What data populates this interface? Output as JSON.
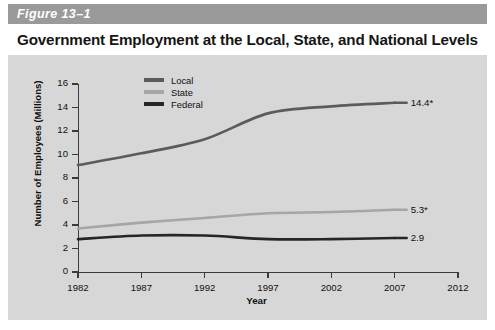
{
  "figure": {
    "label": "Figure 13–1",
    "title": "Government Employment at the Local, State, and National Levels",
    "band_color": "#9a9a9a",
    "panel_color": "#d7d7d7"
  },
  "legend": {
    "position": "top-center-left",
    "items": [
      {
        "label": "Local",
        "color": "#5b5b5b"
      },
      {
        "label": "State",
        "color": "#a6a6a6"
      },
      {
        "label": "Federal",
        "color": "#262626"
      }
    ]
  },
  "axes": {
    "y_title": "Number of Employees (Millions)",
    "x_title": "Year",
    "y_ticks": [
      "0",
      "2",
      "4",
      "6",
      "8",
      "10",
      "12",
      "14",
      "16"
    ],
    "x_ticks": [
      "1982",
      "1987",
      "1992",
      "1997",
      "2002",
      "2007",
      "2012"
    ]
  },
  "series_labels": {
    "local": "14.4*",
    "state": "5.3*",
    "federal": "2.9"
  },
  "chart_data": {
    "type": "line",
    "title": "Government Employment at the Local, State, and National Levels",
    "xlabel": "Year",
    "ylabel": "Number of Employees (Millions)",
    "xlim": [
      1982,
      2012
    ],
    "ylim": [
      0,
      16
    ],
    "ytick_step": 2,
    "grid": false,
    "legend_position": "top-center",
    "x": [
      1982,
      1987,
      1992,
      1997,
      2002,
      2007
    ],
    "series": [
      {
        "name": "Local",
        "color": "#5b5b5b",
        "values": [
          9.1,
          10.1,
          11.3,
          13.5,
          14.1,
          14.4
        ],
        "end_label": "14.4*"
      },
      {
        "name": "State",
        "color": "#a6a6a6",
        "values": [
          3.7,
          4.2,
          4.6,
          5.0,
          5.1,
          5.3
        ],
        "end_label": "5.3*"
      },
      {
        "name": "Federal",
        "color": "#262626",
        "values": [
          2.8,
          3.1,
          3.1,
          2.8,
          2.8,
          2.9
        ],
        "end_label": "2.9"
      }
    ]
  }
}
